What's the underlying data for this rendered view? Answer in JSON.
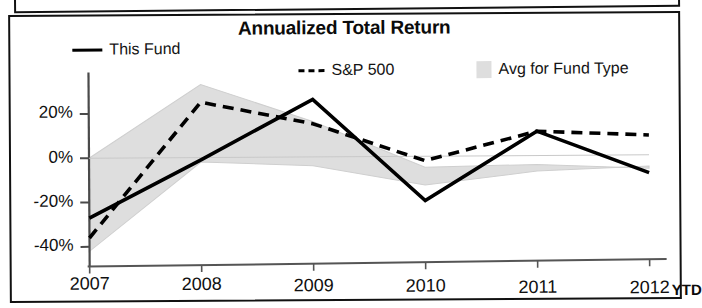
{
  "chart_data": {
    "type": "line",
    "title": "Annualized Total Return",
    "xlabel": "",
    "ylabel": "",
    "categories": [
      "2007",
      "2008",
      "2009",
      "2010",
      "2011",
      "2012"
    ],
    "x_tick_note": "YTD",
    "ytick_labels": [
      "20%",
      "0%",
      "-20%",
      "-40%"
    ],
    "ytick_values": [
      20,
      0,
      -20,
      -40
    ],
    "ylim": [
      -48,
      36
    ],
    "grid": false,
    "legend_position": "top",
    "series": [
      {
        "name": "This Fund",
        "style": "solid",
        "color": "#000000",
        "values": [
          -27,
          -1,
          26,
          -20,
          11,
          -8
        ]
      },
      {
        "name": "S&P 500",
        "style": "dashed",
        "color": "#000000",
        "values": [
          -36,
          25,
          15,
          -2,
          11,
          9
        ]
      },
      {
        "name": "Avg for Fund Type",
        "style": "band",
        "color": "#dedede",
        "band_upper": [
          0,
          33,
          16,
          -5,
          -4,
          -6
        ],
        "band_lower": [
          -42,
          -2,
          -4,
          -13,
          -7,
          -5
        ]
      }
    ]
  },
  "chart": {
    "title": "Annualized Total Return",
    "legend": [
      {
        "label": "This Fund",
        "marker": "solid-line-swatch"
      },
      {
        "label": "S&P 500",
        "marker": "dashed-line-swatch"
      },
      {
        "label": "Avg for Fund Type",
        "marker": "gray-band-swatch"
      }
    ],
    "y_axis": {
      "ticks": [
        "20%",
        "0%",
        "-20%",
        "-40%"
      ]
    },
    "x_axis": {
      "ticks": [
        "2007",
        "2008",
        "2009",
        "2010",
        "2011",
        "2012"
      ],
      "suffix": "YTD"
    }
  }
}
